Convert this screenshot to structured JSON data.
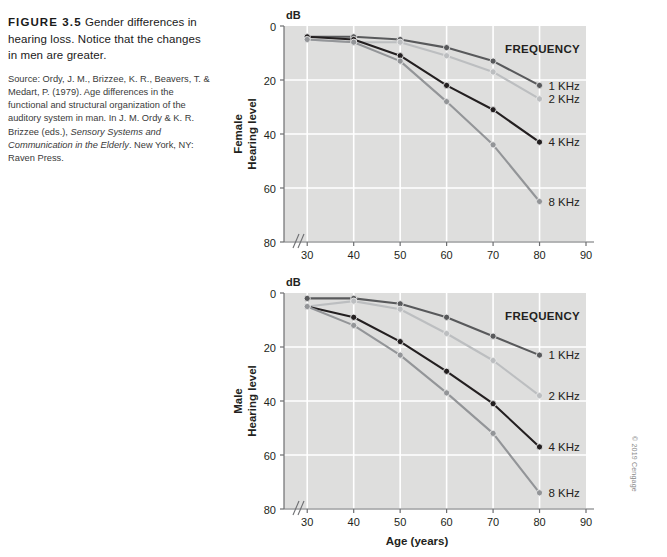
{
  "caption": {
    "figure_number": "FIGURE 3.5",
    "headline": "Gender differences in hearing loss. Notice that the changes in men are greater.",
    "source_plain_1": "Source: Ordy, J. M., Brizzee, K. R., Beavers, T. & Medart, P. (1979). Age differences in the functional and structural organization of the auditory system in man. In J. M. Ordy & K. R. Brizzee (eds.), ",
    "source_italic_1": "Sensory Systems and Communication in the Elderly",
    "source_plain_2": ". New York, NY: Raven Press."
  },
  "copyright": "© 2019 Cengage",
  "colors": {
    "plot_background": "#dededd",
    "gridline": "#ffffff",
    "axis": "#6d6e71",
    "text": "#231f20",
    "series_1khz": "#58595b",
    "series_2khz": "#bcbec0",
    "series_4khz": "#231f20",
    "series_8khz": "#939598"
  },
  "chart_data": [
    {
      "type": "line",
      "id": "female",
      "title": "",
      "panel_label": "Female",
      "ylabel": "Hearing level",
      "yunit": "dB",
      "xlabel": "Age (years)",
      "xticks": [
        30,
        40,
        50,
        60,
        70,
        80,
        90
      ],
      "yticks": [
        0,
        20,
        40,
        60,
        80
      ],
      "xlim": [
        25,
        90
      ],
      "ylim": [
        0,
        80
      ],
      "y_inverted": true,
      "grid": true,
      "axis_break": true,
      "legend_title": "FREQUENCY",
      "legend_position": "right-inline",
      "x": [
        30,
        40,
        50,
        60,
        70,
        80
      ],
      "series": [
        {
          "name": "1 KHz",
          "color": "#58595b",
          "values": [
            4,
            4,
            5,
            8,
            13,
            22
          ]
        },
        {
          "name": "2 KHz",
          "color": "#bcbec0",
          "values": [
            5,
            6,
            6,
            11,
            17,
            27
          ]
        },
        {
          "name": "4 KHz",
          "color": "#231f20",
          "values": [
            4,
            5,
            11,
            22,
            31,
            43
          ]
        },
        {
          "name": "8 KHz",
          "color": "#939598",
          "values": [
            5,
            6,
            13,
            28,
            44,
            65
          ]
        }
      ]
    },
    {
      "type": "line",
      "id": "male",
      "title": "",
      "panel_label": "Male",
      "ylabel": "Hearing level",
      "yunit": "dB",
      "xlabel": "Age (years)",
      "xticks": [
        30,
        40,
        50,
        60,
        70,
        80,
        90
      ],
      "yticks": [
        0,
        20,
        40,
        60,
        80
      ],
      "xlim": [
        25,
        90
      ],
      "ylim": [
        0,
        80
      ],
      "y_inverted": true,
      "grid": true,
      "axis_break": true,
      "legend_title": "FREQUENCY",
      "legend_position": "right-inline",
      "x": [
        30,
        40,
        50,
        60,
        70,
        80
      ],
      "series": [
        {
          "name": "1 KHz",
          "color": "#58595b",
          "values": [
            2,
            2,
            4,
            9,
            16,
            23
          ]
        },
        {
          "name": "2 KHz",
          "color": "#bcbec0",
          "values": [
            5,
            3,
            6,
            15,
            25,
            38
          ]
        },
        {
          "name": "4 KHz",
          "color": "#231f20",
          "values": [
            5,
            9,
            18,
            29,
            41,
            57
          ]
        },
        {
          "name": "8 KHz",
          "color": "#939598",
          "values": [
            5,
            12,
            23,
            37,
            52,
            74
          ]
        }
      ]
    }
  ]
}
